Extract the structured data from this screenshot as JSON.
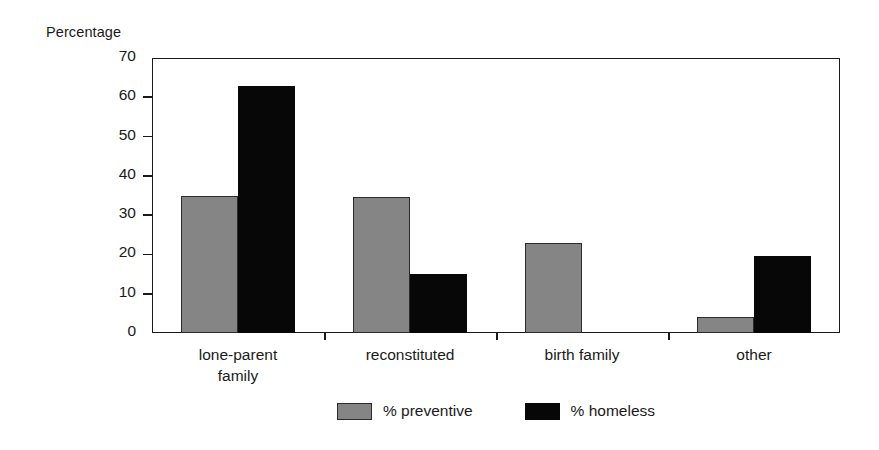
{
  "chart_data": {
    "type": "bar",
    "title": "",
    "xlabel": "",
    "ylabel": "Percentage",
    "ylim": [
      0,
      70
    ],
    "yticks": [
      0,
      10,
      20,
      30,
      40,
      50,
      60,
      70
    ],
    "ytick_labels": [
      "0",
      "10",
      "20",
      "30",
      "40",
      "50",
      "60",
      "70"
    ],
    "grid": false,
    "legend_position": "bottom-center",
    "categories": [
      "lone-parent\nfamily",
      "reconstituted",
      "birth family",
      "other"
    ],
    "series": [
      {
        "name": "% preventive",
        "color": "#858585",
        "values": [
          35,
          34.5,
          23,
          4
        ]
      },
      {
        "name": "% homeless",
        "color": "#070707",
        "values": [
          63,
          15,
          0,
          19.5
        ]
      }
    ]
  },
  "axis": {
    "y_title": "Percentage"
  },
  "legend": {
    "items": [
      {
        "label": "% preventive",
        "color": "#858585"
      },
      {
        "label": "% homeless",
        "color": "#070707"
      }
    ]
  }
}
